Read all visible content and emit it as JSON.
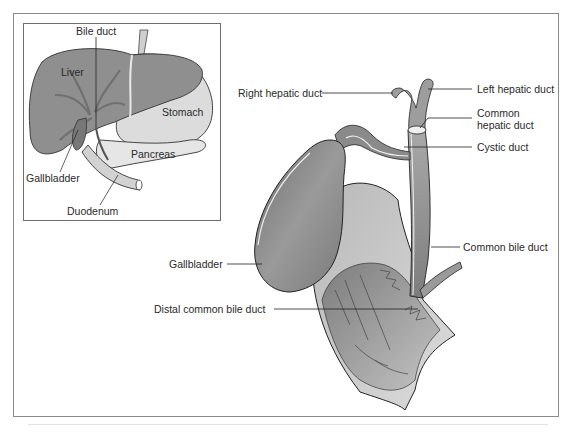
{
  "figure": {
    "inset": {
      "labels": {
        "bile_duct": "Bile duct",
        "liver": "Liver",
        "stomach": "Stomach",
        "pancreas": "Pancreas",
        "gallbladder": "Gallbladder",
        "duodenum": "Duodenum"
      }
    },
    "main": {
      "labels": {
        "right_hepatic_duct": "Right hepatic duct",
        "left_hepatic_duct": "Left hepatic duct",
        "common_hepatic_duct": "Common hepatic duct",
        "cystic_duct": "Cystic duct",
        "common_bile_duct": "Common bile duct",
        "gallbladder": "Gallbladder",
        "distal_common_bile_duct": "Distal common bile duct"
      }
    },
    "colors": {
      "frame": "#8a8a8a",
      "organ_dark": "#7a7a7a",
      "organ_mid": "#a4a4a4",
      "organ_light": "#d8d8d8",
      "outline": "#333333"
    }
  }
}
